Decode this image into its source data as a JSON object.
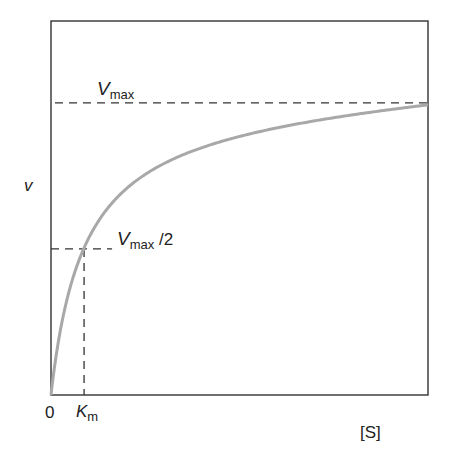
{
  "chart_data": {
    "type": "line",
    "title": "",
    "xlabel": "[S]",
    "ylabel": "v",
    "x_ticks": [
      {
        "label": "0",
        "value": 0
      },
      {
        "label": "Km",
        "value": 1
      }
    ],
    "annotations": [
      {
        "text": "Vmax",
        "type": "horizontal-dashed-line",
        "y": 1.0
      },
      {
        "text": "Vmax/2",
        "type": "horizontal-dashed-line",
        "y": 0.5,
        "x_end": 1
      },
      {
        "text": "Km",
        "type": "vertical-dashed-line",
        "x": 1,
        "y_end": 0.5
      }
    ],
    "series": [
      {
        "name": "Michaelis-Menten curve",
        "equation": "v = Vmax*[S]/(Km+[S])",
        "Vmax": 1.0,
        "Km": 1,
        "x": [
          0,
          0.25,
          0.5,
          1,
          1.5,
          2,
          3,
          4,
          5,
          6,
          8,
          10,
          11.4
        ],
        "y": [
          0,
          0.2,
          0.333,
          0.5,
          0.6,
          0.667,
          0.75,
          0.8,
          0.833,
          0.857,
          0.889,
          0.909,
          0.919
        ]
      }
    ],
    "xlim": [
      0,
      11.4
    ],
    "ylim": [
      0,
      1.28
    ],
    "grid": false,
    "legend": "none",
    "colors": {
      "curve": "#a8a8a8",
      "frame": "#333333",
      "dash": "#333333"
    }
  },
  "labels": {
    "y_axis": "v",
    "x_axis": "[S]",
    "origin": "0",
    "km_main": "K",
    "km_sub": "m",
    "vmax_main": "V",
    "vmax_sub": "max",
    "half_main": "V",
    "half_sub": "max",
    "half_suffix": " /2"
  }
}
